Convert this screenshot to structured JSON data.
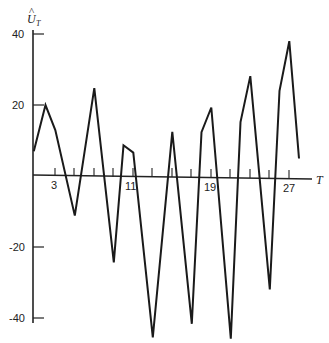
{
  "chart_data": {
    "type": "line",
    "title": "",
    "xlabel": "T",
    "ylabel": "Û_T",
    "ylabel_main": "U",
    "ylabel_sub": "T",
    "ylabel_hat": "^",
    "x_tick_labels": [
      "3",
      "11",
      "19",
      "27"
    ],
    "x_ticks": [
      3,
      5,
      7,
      9,
      11,
      13,
      15,
      17,
      19,
      21,
      23,
      25,
      27
    ],
    "y_tick_labels": [
      "40",
      "20",
      "-20",
      "-40"
    ],
    "y_ticks": [
      40,
      20,
      -20,
      -40
    ],
    "xlim": [
      1,
      29
    ],
    "ylim": [
      -45,
      42
    ],
    "grid": false,
    "legend": null,
    "series": [
      {
        "name": "Û_T",
        "x": [
          1,
          2,
          3,
          5,
          7,
          9,
          10,
          11,
          13,
          15,
          17,
          18,
          19,
          21,
          22,
          23,
          25,
          26,
          27,
          28
        ],
        "values": [
          7,
          20,
          13,
          -11,
          25,
          -24,
          9,
          7,
          -45,
          13,
          -41,
          13,
          20,
          -45,
          16,
          29,
          -31,
          25,
          39,
          6
        ]
      }
    ]
  }
}
